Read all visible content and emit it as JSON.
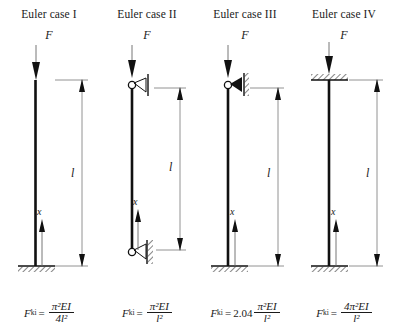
{
  "figure": {
    "caption": "Euler buckling cases I-IV",
    "dimension_label": "l",
    "axis_label": "x",
    "load_label": "F",
    "column_color": "#111111",
    "hatch_color": "#555555"
  },
  "panels": [
    {
      "id": "euler-case-1",
      "title": "Euler case I",
      "load_label": "F",
      "dimension_label": "l",
      "axis_label": "x",
      "top_support": "free",
      "bottom_support": "fixed",
      "formula": {
        "symbol": "F",
        "subscript": "ki",
        "equals": "=",
        "coefficient": "",
        "numerator": "π²EI",
        "denominator": "4l²",
        "plain": "F_ki = π²EI / 4l²"
      }
    },
    {
      "id": "euler-case-2",
      "title": "Euler case II",
      "load_label": "F",
      "dimension_label": "l",
      "axis_label": "x",
      "top_support": "pinned-roller",
      "bottom_support": "pinned",
      "formula": {
        "symbol": "F",
        "subscript": "ki",
        "equals": "=",
        "coefficient": "",
        "numerator": "π²EI",
        "denominator": "l²",
        "plain": "F_ki = π²EI / l²"
      }
    },
    {
      "id": "euler-case-3",
      "title": "Euler case III",
      "load_label": "F",
      "dimension_label": "l",
      "axis_label": "x",
      "top_support": "pinned-roller",
      "bottom_support": "fixed",
      "formula": {
        "symbol": "F",
        "subscript": "ki",
        "equals": "=",
        "coefficient": "2.04",
        "numerator": "π²EI",
        "denominator": "l²",
        "plain": "F_ki = 2.04 π²EI / l²"
      }
    },
    {
      "id": "euler-case-4",
      "title": "Euler case IV",
      "load_label": "F",
      "dimension_label": "l",
      "axis_label": "x",
      "top_support": "guided-fixed",
      "bottom_support": "fixed",
      "formula": {
        "symbol": "F",
        "subscript": "ki",
        "equals": "=",
        "coefficient": "",
        "numerator": "4π²EI",
        "denominator": "l²",
        "plain": "F_ki = 4π²EI / l²"
      }
    }
  ]
}
